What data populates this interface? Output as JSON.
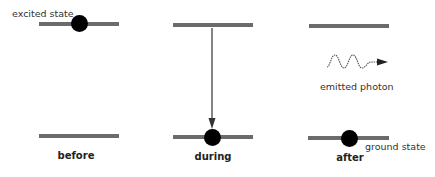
{
  "diagram": {
    "labels": {
      "excited_state": "excited state",
      "ground_state": "ground state",
      "emitted_photon": "emitted photon"
    },
    "stages": [
      {
        "id": "before",
        "label": "before",
        "electron_level": "excited"
      },
      {
        "id": "during",
        "label": "during",
        "electron_level": "ground",
        "transition_arrow": "down"
      },
      {
        "id": "after",
        "label": "after",
        "electron_level": "ground",
        "photon_emitted": true
      }
    ],
    "colors": {
      "level_line": "#6b6b6b",
      "electron": "#000000",
      "arrow": "#333333",
      "photon_wave": "#555555"
    }
  }
}
